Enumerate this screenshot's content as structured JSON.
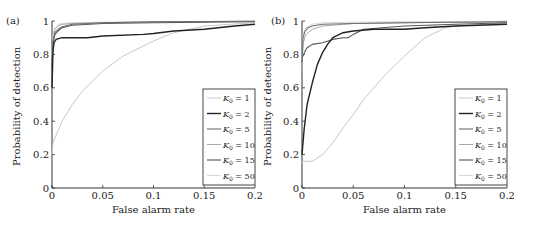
{
  "chart_data": [
    {
      "type": "line",
      "panel_label": "(a)",
      "xlabel": "False alarm rate",
      "ylabel": "Probability of detection",
      "xlim": [
        0,
        0.2
      ],
      "ylim": [
        0,
        1
      ],
      "xticks": [
        "0",
        "0.05",
        "0.1",
        "0.15",
        "0.2"
      ],
      "yticks": [
        "0",
        "0.2",
        "0.4",
        "0.6",
        "0.8",
        "1"
      ],
      "legend_placement": "right-middle",
      "series": [
        {
          "name": "K0 = 1",
          "sub": "0",
          "value": "1",
          "color": "#c8c8c8",
          "width": 1,
          "x": [
            0,
            0.001,
            0.003,
            0.005,
            0.01,
            0.02,
            0.03,
            0.05,
            0.07,
            0.1,
            0.12,
            0.15,
            0.2
          ],
          "y": [
            0.2,
            0.27,
            0.3,
            0.33,
            0.4,
            0.5,
            0.58,
            0.7,
            0.79,
            0.88,
            0.93,
            0.97,
            0.99
          ]
        },
        {
          "name": "K0 = 2",
          "sub": "0",
          "value": "2",
          "color": "#222222",
          "width": 1.4,
          "x": [
            0,
            0.001,
            0.002,
            0.004,
            0.01,
            0.035,
            0.05,
            0.09,
            0.1,
            0.12,
            0.15,
            0.18,
            0.2
          ],
          "y": [
            0.6,
            0.82,
            0.87,
            0.89,
            0.9,
            0.9,
            0.91,
            0.92,
            0.925,
            0.94,
            0.95,
            0.97,
            0.98
          ]
        },
        {
          "name": "K0 = 5",
          "sub": "0",
          "value": "5",
          "color": "#6e6e6e",
          "width": 1.1,
          "x": [
            0,
            0.001,
            0.003,
            0.006,
            0.01,
            0.02,
            0.05,
            0.1,
            0.2
          ],
          "y": [
            0.7,
            0.88,
            0.93,
            0.95,
            0.965,
            0.98,
            0.99,
            0.995,
            0.998
          ]
        },
        {
          "name": "K0 = 10",
          "sub": "0",
          "value": "10",
          "color": "#a8a8a8",
          "width": 1,
          "x": [
            0,
            0.001,
            0.003,
            0.006,
            0.01,
            0.02,
            0.05,
            0.1,
            0.2
          ],
          "y": [
            0.75,
            0.9,
            0.95,
            0.97,
            0.98,
            0.985,
            0.99,
            0.995,
            0.998
          ]
        },
        {
          "name": "K0 = 15",
          "sub": "0",
          "value": "15",
          "color": "#555555",
          "width": 1.1,
          "x": [
            0,
            0.001,
            0.003,
            0.006,
            0.01,
            0.02,
            0.05,
            0.1,
            0.2
          ],
          "y": [
            0.72,
            0.87,
            0.92,
            0.94,
            0.96,
            0.975,
            0.985,
            0.99,
            0.995
          ]
        },
        {
          "name": "K0 = 50",
          "sub": "0",
          "value": "50",
          "color": "#d8d8d8",
          "width": 1,
          "x": [
            0,
            0.001,
            0.003,
            0.006,
            0.01,
            0.02,
            0.05,
            0.1,
            0.2
          ],
          "y": [
            0.8,
            0.92,
            0.96,
            0.98,
            0.985,
            0.99,
            0.993,
            0.996,
            0.999
          ]
        }
      ]
    },
    {
      "type": "line",
      "panel_label": "(b)",
      "xlabel": "False alarm rate",
      "ylabel": "Probability of detection",
      "xlim": [
        0,
        0.2
      ],
      "ylim": [
        0,
        1
      ],
      "xticks": [
        "0",
        "0.05",
        "0.1",
        "0.15",
        "0.2"
      ],
      "yticks": [
        "0",
        "0.2",
        "0.4",
        "0.6",
        "0.8",
        "1"
      ],
      "legend_placement": "right-middle",
      "series": [
        {
          "name": "K0 = 1",
          "sub": "0",
          "value": "1",
          "color": "#c8c8c8",
          "width": 1,
          "x": [
            0,
            0.001,
            0.01,
            0.015,
            0.02,
            0.03,
            0.04,
            0.05,
            0.06,
            0.07,
            0.08,
            0.1,
            0.12,
            0.14,
            0.15,
            0.2
          ],
          "y": [
            0.15,
            0.16,
            0.16,
            0.18,
            0.2,
            0.27,
            0.36,
            0.44,
            0.53,
            0.6,
            0.67,
            0.79,
            0.9,
            0.96,
            0.97,
            0.99
          ]
        },
        {
          "name": "K0 = 2",
          "sub": "0",
          "value": "2",
          "color": "#222222",
          "width": 1.4,
          "x": [
            0,
            0.002,
            0.005,
            0.01,
            0.015,
            0.02,
            0.025,
            0.03,
            0.04,
            0.05,
            0.07,
            0.1,
            0.12,
            0.15,
            0.2
          ],
          "y": [
            0.2,
            0.35,
            0.5,
            0.63,
            0.74,
            0.81,
            0.86,
            0.9,
            0.93,
            0.94,
            0.95,
            0.95,
            0.96,
            0.97,
            0.98
          ]
        },
        {
          "name": "K0 = 5",
          "sub": "0",
          "value": "5",
          "color": "#6e6e6e",
          "width": 1.1,
          "x": [
            0,
            0.001,
            0.003,
            0.006,
            0.01,
            0.02,
            0.05,
            0.1,
            0.2
          ],
          "y": [
            0.75,
            0.9,
            0.94,
            0.96,
            0.97,
            0.98,
            0.985,
            0.99,
            0.995
          ]
        },
        {
          "name": "K0 = 10",
          "sub": "0",
          "value": "10",
          "color": "#a8a8a8",
          "width": 1,
          "x": [
            0,
            0.001,
            0.003,
            0.006,
            0.01,
            0.02,
            0.05,
            0.1,
            0.2
          ],
          "y": [
            0.7,
            0.86,
            0.91,
            0.93,
            0.95,
            0.97,
            0.985,
            0.99,
            0.995
          ]
        },
        {
          "name": "K0 = 15",
          "sub": "0",
          "value": "15",
          "color": "#555555",
          "width": 1.1,
          "x": [
            0,
            0.001,
            0.003,
            0.005,
            0.01,
            0.02,
            0.03,
            0.04,
            0.045,
            0.05,
            0.06,
            0.1,
            0.15,
            0.2
          ],
          "y": [
            0.8,
            0.79,
            0.82,
            0.84,
            0.86,
            0.87,
            0.89,
            0.9,
            0.9,
            0.92,
            0.95,
            0.97,
            0.98,
            0.99
          ]
        },
        {
          "name": "K0 = 50",
          "sub": "0",
          "value": "50",
          "color": "#d8d8d8",
          "width": 1,
          "x": [
            0,
            0.001,
            0.003,
            0.006,
            0.01,
            0.02,
            0.05,
            0.1,
            0.2
          ],
          "y": [
            0.78,
            0.92,
            0.95,
            0.97,
            0.98,
            0.99,
            0.993,
            0.996,
            0.999
          ]
        }
      ]
    }
  ]
}
